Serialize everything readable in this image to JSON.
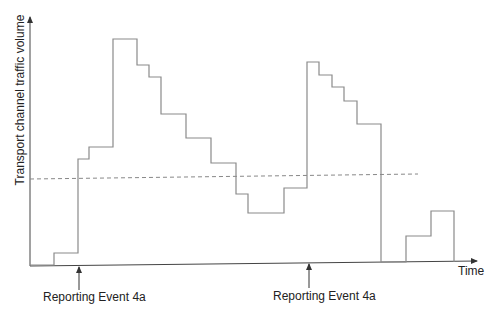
{
  "diagram": {
    "y_axis_label": "Transport channel traffic volume",
    "x_axis_label": "Time",
    "threshold": {
      "style": "dashed",
      "y_px": 177
    },
    "events": [
      {
        "label": "Reporting Event 4a",
        "x_px": 79
      },
      {
        "label": "Reporting Event 4a",
        "x_px": 309
      }
    ],
    "colors": {
      "line": "#8a8a8a",
      "axis": "#444444",
      "dashed": "#888888",
      "text": "#222222"
    }
  },
  "chart_data": {
    "type": "line",
    "title": "",
    "xlabel": "Time",
    "ylabel": "Transport channel traffic volume",
    "step_curve_px": [
      [
        30,
        265
      ],
      [
        54,
        265
      ],
      [
        54,
        253
      ],
      [
        78,
        253
      ],
      [
        78,
        159
      ],
      [
        89,
        159
      ],
      [
        89,
        147
      ],
      [
        113,
        147
      ],
      [
        113,
        39
      ],
      [
        137,
        39
      ],
      [
        137,
        65
      ],
      [
        149,
        65
      ],
      [
        149,
        77
      ],
      [
        161,
        77
      ],
      [
        161,
        114
      ],
      [
        186,
        114
      ],
      [
        186,
        138
      ],
      [
        211,
        138
      ],
      [
        211,
        163
      ],
      [
        236,
        163
      ],
      [
        236,
        194
      ],
      [
        248,
        194
      ],
      [
        248,
        213
      ],
      [
        284,
        213
      ],
      [
        284,
        188
      ],
      [
        307,
        188
      ],
      [
        307,
        62
      ],
      [
        319,
        62
      ],
      [
        319,
        75
      ],
      [
        332,
        75
      ],
      [
        332,
        87
      ],
      [
        344,
        87
      ],
      [
        344,
        101
      ],
      [
        357,
        101
      ],
      [
        357,
        124
      ],
      [
        381,
        124
      ],
      [
        381,
        262
      ],
      [
        406,
        262
      ],
      [
        406,
        236
      ],
      [
        431,
        236
      ],
      [
        431,
        211
      ],
      [
        454,
        211
      ],
      [
        454,
        262
      ]
    ],
    "threshold_y_px": 177,
    "annotations": [
      "Reporting Event 4a",
      "Reporting Event 4a"
    ]
  }
}
